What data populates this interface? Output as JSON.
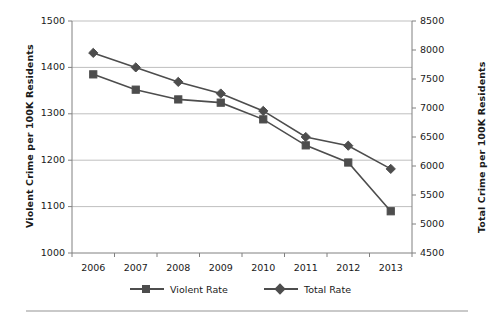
{
  "chart_data": {
    "type": "line",
    "title": "",
    "xlabel": "",
    "categories": [
      "2006",
      "2007",
      "2008",
      "2009",
      "2010",
      "2011",
      "2012",
      "2013"
    ],
    "x": [
      2006,
      2007,
      2008,
      2009,
      2010,
      2011,
      2012,
      2013
    ],
    "grid": true,
    "legend_position": "bottom",
    "series": [
      {
        "name": "Violent Rate",
        "axis": "left",
        "marker": "square",
        "color": "#4d4d4d",
        "values": [
          1385,
          1352,
          1331,
          1324,
          1288,
          1232,
          1195,
          1090
        ]
      },
      {
        "name": "Total Rate",
        "axis": "right",
        "marker": "diamond",
        "color": "#4d4d4d",
        "values": [
          7950,
          7700,
          7450,
          7250,
          6950,
          6500,
          6350,
          5950
        ]
      }
    ],
    "left_axis": {
      "label": "Violent Crime per 100K Residents",
      "ylim": [
        1000,
        1500
      ],
      "ticks": [
        1000,
        1100,
        1200,
        1300,
        1400,
        1500
      ],
      "tick_labels": [
        "1000",
        "1100",
        "1200",
        "1300",
        "1400",
        "1500"
      ]
    },
    "right_axis": {
      "label": "Total Crime per 100K Residents",
      "ylim": [
        4500,
        8500
      ],
      "ticks": [
        4500,
        5000,
        5500,
        6000,
        6500,
        7000,
        7500,
        8000,
        8500
      ],
      "tick_labels": [
        "4500",
        "5000",
        "5500",
        "6000",
        "6500",
        "7000",
        "7500",
        "8000",
        "8500"
      ]
    }
  },
  "legend": {
    "items": [
      {
        "label": "Violent Rate",
        "marker": "square"
      },
      {
        "label": "Total Rate",
        "marker": "diamond"
      }
    ]
  },
  "caption": {
    "fragment": ""
  },
  "colors": {
    "series": "#4d4d4d",
    "gridline": "#bfbfbf",
    "axis": "#808080",
    "text": "#1a1a1a",
    "divider": "#c9c9c9",
    "background": "#ffffff"
  }
}
